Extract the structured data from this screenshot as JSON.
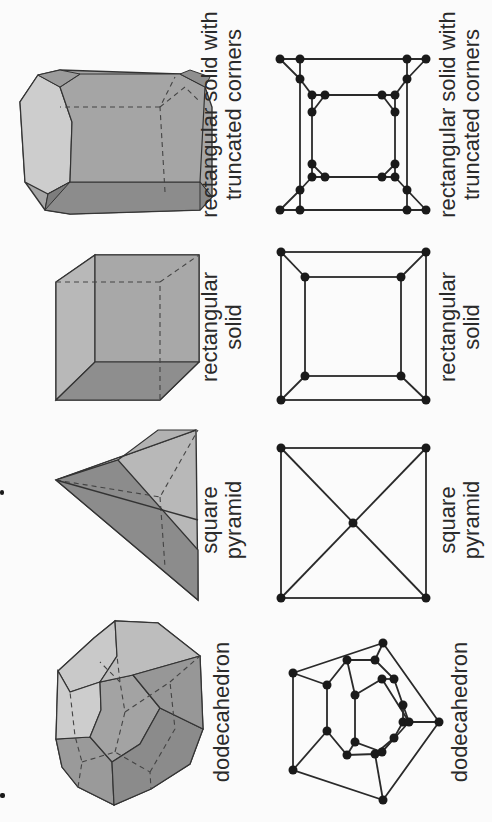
{
  "figure": {
    "orientation": "rotated 90° counter-clockwise",
    "rows": [
      "3D solids",
      "planar graphs"
    ],
    "columns": [
      {
        "id": "dodecahedron",
        "solid_label": "dodecahedron",
        "graph_label": "dodecahedron"
      },
      {
        "id": "square-pyramid",
        "solid_label": "square\npyramid",
        "graph_label": "square\npyramid"
      },
      {
        "id": "rectangular-solid",
        "solid_label": "rectangular\nsolid",
        "graph_label": "rectangular\nsolid"
      },
      {
        "id": "truncated-solid",
        "solid_label": "rectangular solid with\ntruncated corners",
        "graph_label": "rectangular solid with\ntruncated corners"
      }
    ]
  },
  "colors": {
    "background": "#fbfbfb",
    "face_light": "#cfcfcf",
    "face_mid": "#a9a9a9",
    "face_dark": "#8a8a8a",
    "edge": "#333333",
    "vertex": "#1a1a1a",
    "text": "#2a2a2a"
  },
  "graphs": {
    "dodecahedron": {
      "vertices": 20,
      "edges": 30
    },
    "square_pyramid": {
      "vertices": 5,
      "edges": 8
    },
    "rectangular_solid": {
      "vertices": 8,
      "edges": 12
    },
    "truncated_solid": {
      "vertices": 24,
      "edges": 36
    }
  }
}
